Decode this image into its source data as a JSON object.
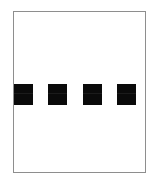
{
  "figure": {
    "title": "",
    "background_color": "#ffffff",
    "frame": {
      "visible": true,
      "border_color": "#8e8e8e",
      "border_width_px": 1,
      "fill_color": "#ffffff"
    },
    "markers": {
      "count": 4,
      "shape": "square",
      "fill_color": "#0a0a0a",
      "items": [
        {
          "label": "",
          "index": "1"
        },
        {
          "label": "",
          "index": "2"
        },
        {
          "label": "",
          "index": "3"
        },
        {
          "label": "",
          "index": "4"
        }
      ]
    },
    "caption": ""
  },
  "chart_data": {
    "type": "bar",
    "title": "",
    "xlabel": "",
    "ylabel": "",
    "categories": [
      "1",
      "2",
      "3",
      "4"
    ],
    "values": [
      1,
      1,
      1,
      1
    ],
    "ylim": [
      0,
      1
    ],
    "grid": false,
    "legend": "none",
    "series": [
      {
        "name": "marker",
        "values": [
          1,
          1,
          1,
          1
        ],
        "color": "#0a0a0a"
      }
    ],
    "annotations": []
  }
}
